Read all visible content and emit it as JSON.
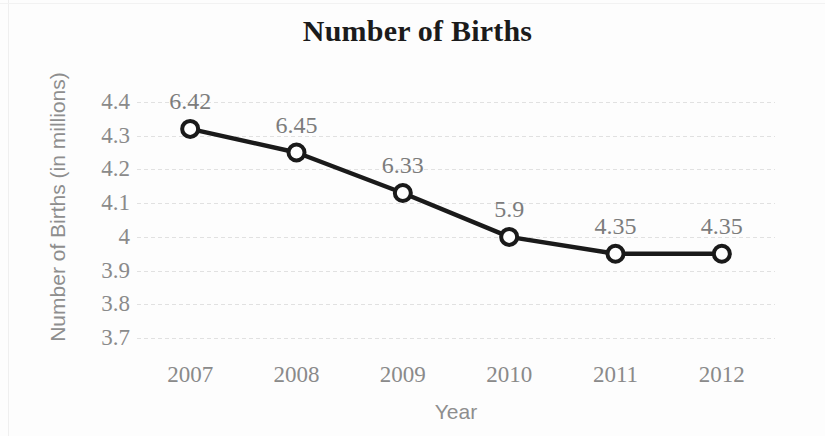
{
  "chart_data": {
    "type": "line",
    "title": "Number of Births",
    "xlabel": "Year",
    "ylabel": "Number of Births (in millions)",
    "categories": [
      "2007",
      "2008",
      "2009",
      "2010",
      "2011",
      "2012"
    ],
    "values": [
      4.32,
      4.25,
      4.13,
      4.0,
      3.95,
      3.95
    ],
    "point_labels": [
      "6.42",
      "6.45",
      "6.33",
      "5.9",
      "4.35",
      "4.35"
    ],
    "ylim": [
      3.65,
      4.45
    ],
    "yticks": [
      "4.4",
      "4.3",
      "4.2",
      "4.1",
      "4",
      "3.9",
      "3.8",
      "3.7"
    ],
    "ytick_values": [
      4.4,
      4.3,
      4.2,
      4.1,
      4.0,
      3.9,
      3.8,
      3.7
    ],
    "grid": true,
    "legend": "none",
    "series": [
      {
        "name": "Number of Births",
        "values": [
          4.32,
          4.25,
          4.13,
          4.0,
          3.95,
          3.95
        ],
        "labels": [
          "6.42",
          "6.45",
          "6.33",
          "5.9",
          "4.35",
          "4.35"
        ]
      }
    ],
    "colors": {
      "line": "#1a1a1a",
      "marker_fill": "#ffffff",
      "marker_stroke": "#1a1a1a",
      "grid": "#dcdcdc",
      "tick_text": "#8a8a8a",
      "axis_title": "#8e8e8e",
      "title_text": "#1b1b1b",
      "background": "#fdfdfd"
    }
  }
}
